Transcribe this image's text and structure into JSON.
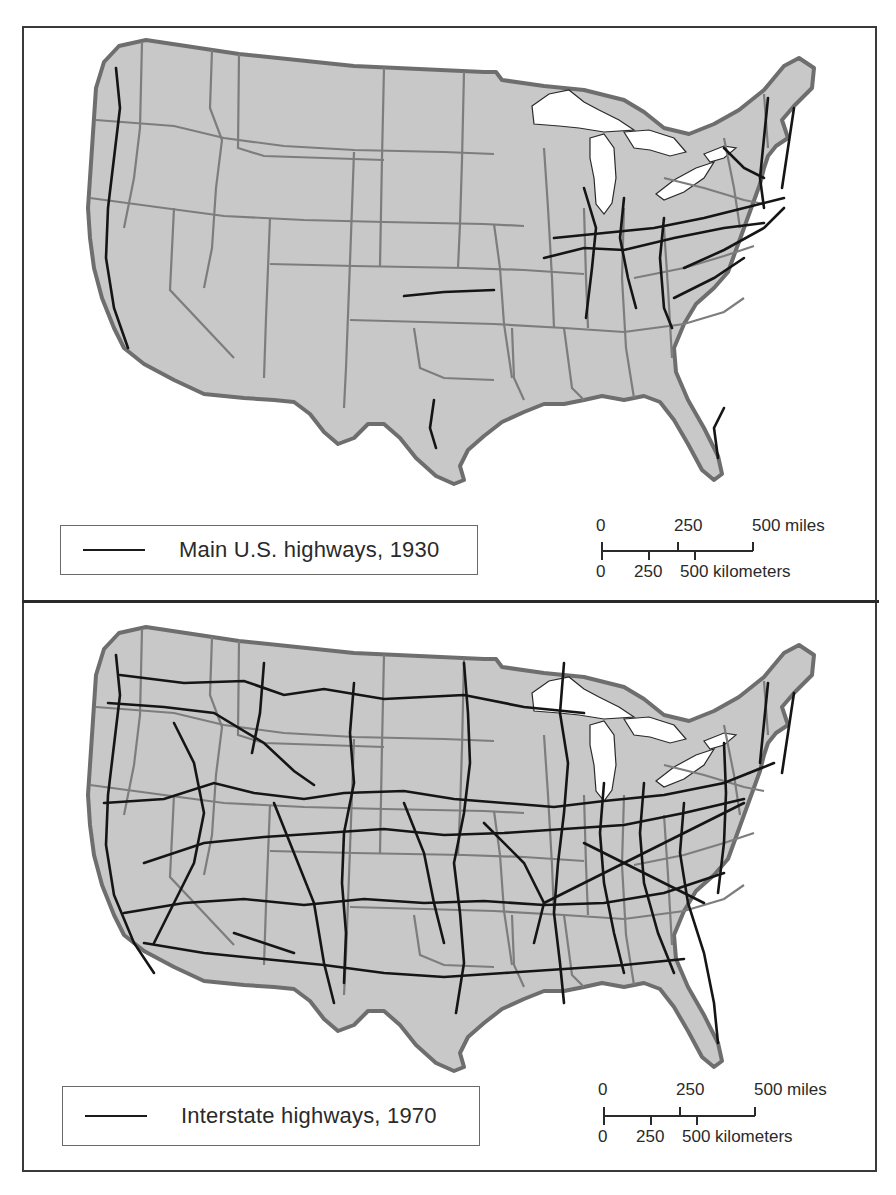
{
  "colors": {
    "land": "#c8c8c8",
    "state_border": "#7d7d7d",
    "national_border": "#6e6e6e",
    "highway": "#151515",
    "water": "#ffffff",
    "frame": "#3a3a3a"
  },
  "panels": [
    {
      "id": "1930",
      "legend": {
        "label": "Main U.S. highways, 1930",
        "symbol": "line-icon"
      },
      "scale": {
        "miles_ticks": [
          "0",
          "250",
          "500 miles"
        ],
        "km_ticks": [
          "0",
          "250",
          "500 kilometers"
        ]
      }
    },
    {
      "id": "1970",
      "legend": {
        "label": "Interstate highways, 1970",
        "symbol": "line-icon"
      },
      "scale": {
        "miles_ticks": [
          "0",
          "250",
          "500 miles"
        ],
        "km_ticks": [
          "0",
          "250",
          "500 kilometers"
        ]
      }
    }
  ]
}
